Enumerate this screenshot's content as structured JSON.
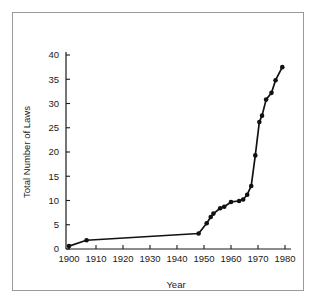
{
  "chart_data": {
    "type": "line",
    "title": "",
    "xlabel": "Year",
    "ylabel": "Total Number of Laws",
    "xlim": [
      1897,
      1982
    ],
    "ylim": [
      0,
      42
    ],
    "xticks": [
      1900,
      1910,
      1920,
      1930,
      1940,
      1950,
      1960,
      1970,
      1980
    ],
    "xtick_labels": [
      "1900",
      "1910",
      "1920",
      "1930",
      "1940",
      "1950",
      "1960",
      "1970",
      "1980"
    ],
    "yticks": [
      0,
      5,
      10,
      15,
      20,
      25,
      30,
      35,
      40
    ],
    "ytick_labels": [
      "0",
      "5",
      "10",
      "15",
      "20",
      "25",
      "30",
      "35",
      "40"
    ],
    "grid": false,
    "legend": null,
    "marker": "filled-circle",
    "line_color": "#111111",
    "marker_color": "#111111",
    "x": [
      1900,
      1906.5,
      1948,
      1951,
      1952.5,
      1953.5,
      1956,
      1957.5,
      1960,
      1963,
      1964.5,
      1966,
      1967.5,
      1969,
      1970.5,
      1971.5,
      1973,
      1975,
      1976.5,
      1979
    ],
    "y": [
      0.6,
      1.8,
      3.2,
      5.3,
      6.6,
      7.3,
      8.4,
      8.7,
      9.7,
      9.9,
      10.2,
      11.2,
      13.0,
      19.3,
      26.2,
      27.5,
      30.8,
      32.2,
      34.8,
      37.5
    ],
    "points": [
      {
        "year": 1900,
        "laws": 0.6
      },
      {
        "year": 1906.5,
        "laws": 1.8
      },
      {
        "year": 1948,
        "laws": 3.2
      },
      {
        "year": 1951,
        "laws": 5.3
      },
      {
        "year": 1952.5,
        "laws": 6.6
      },
      {
        "year": 1953.5,
        "laws": 7.3
      },
      {
        "year": 1956,
        "laws": 8.4
      },
      {
        "year": 1957.5,
        "laws": 8.7
      },
      {
        "year": 1960,
        "laws": 9.7
      },
      {
        "year": 1963,
        "laws": 9.9
      },
      {
        "year": 1964.5,
        "laws": 10.2
      },
      {
        "year": 1966,
        "laws": 11.2
      },
      {
        "year": 1967.5,
        "laws": 13.0
      },
      {
        "year": 1969,
        "laws": 19.3
      },
      {
        "year": 1970.5,
        "laws": 26.2
      },
      {
        "year": 1971.5,
        "laws": 27.5
      },
      {
        "year": 1973,
        "laws": 30.8
      },
      {
        "year": 1975,
        "laws": 32.2
      },
      {
        "year": 1976.5,
        "laws": 34.8
      },
      {
        "year": 1979,
        "laws": 37.5
      }
    ]
  },
  "figure": {
    "background_color": "#ffffff",
    "frame_color": "#9a9a9a",
    "axis_color": "#1a1a1a"
  }
}
